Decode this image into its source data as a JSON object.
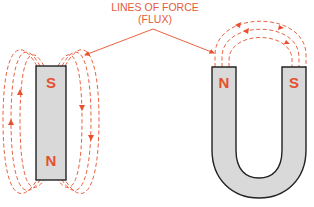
{
  "title": {
    "line1": "LINES OF FORCE",
    "line2": "(FLUX)"
  },
  "bar_magnet": {
    "top_pole": "S",
    "bottom_pole": "N"
  },
  "horseshoe_magnet": {
    "left_pole": "N",
    "right_pole": "S"
  },
  "colors": {
    "flux": "#e8502e",
    "magnet_fill": "#d9d9d9",
    "outline": "#222222",
    "pole_label": "#e4502e"
  }
}
